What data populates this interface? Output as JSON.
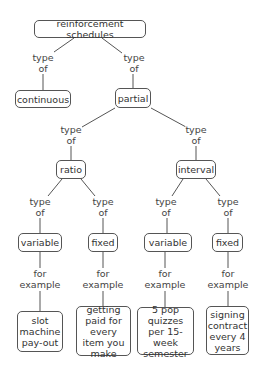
{
  "diagram": {
    "type": "concept-map",
    "nodes": {
      "root": "reinforcement schedules",
      "continuous": "continuous",
      "partial": "partial",
      "ratio": "ratio",
      "interval": "interval",
      "ratio_variable": "variable",
      "ratio_fixed": "fixed",
      "interval_variable": "variable",
      "interval_fixed": "fixed",
      "ex_ratio_variable": "slot machine pay-out",
      "ex_ratio_fixed": "getting paid for every item you make",
      "ex_interval_variable": "5 pop quizzes per 15-week semester",
      "ex_interval_fixed": "signing contract every 4 years"
    },
    "link_labels": {
      "type_of_1": "type",
      "type_of_2": "of",
      "for_example_1": "for",
      "for_example_2": "example"
    },
    "edges": [
      {
        "from": "root",
        "to": "continuous",
        "label": "type of"
      },
      {
        "from": "root",
        "to": "partial",
        "label": "type of"
      },
      {
        "from": "partial",
        "to": "ratio",
        "label": "type of"
      },
      {
        "from": "partial",
        "to": "interval",
        "label": "type of"
      },
      {
        "from": "ratio",
        "to": "ratio_variable",
        "label": "type of"
      },
      {
        "from": "ratio",
        "to": "ratio_fixed",
        "label": "type of"
      },
      {
        "from": "interval",
        "to": "interval_variable",
        "label": "type of"
      },
      {
        "from": "interval",
        "to": "interval_fixed",
        "label": "type of"
      },
      {
        "from": "ratio_variable",
        "to": "ex_ratio_variable",
        "label": "for example"
      },
      {
        "from": "ratio_fixed",
        "to": "ex_ratio_fixed",
        "label": "for example"
      },
      {
        "from": "interval_variable",
        "to": "ex_interval_variable",
        "label": "for example"
      },
      {
        "from": "interval_fixed",
        "to": "ex_interval_fixed",
        "label": "for example"
      }
    ]
  }
}
